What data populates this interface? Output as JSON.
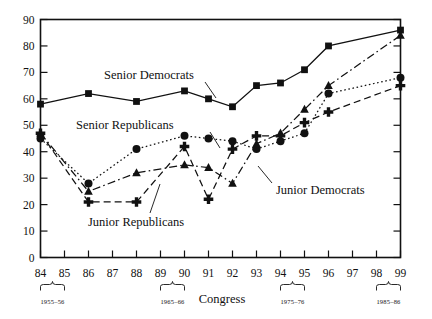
{
  "chart_data": {
    "type": "line",
    "title": "",
    "xlabel": "Congress",
    "ylabel": "",
    "ylim": [
      0,
      90
    ],
    "yticks": [
      0,
      10,
      20,
      30,
      40,
      50,
      60,
      70,
      80,
      90
    ],
    "xticks": [
      "84",
      "85",
      "86",
      "87",
      "88",
      "89",
      "90",
      "91",
      "92",
      "93",
      "94",
      "95",
      "96",
      "97",
      "98",
      "99"
    ],
    "grid": false,
    "legend": "inline-annotations",
    "x": [
      84,
      86,
      88,
      90,
      91,
      92,
      93,
      94,
      95,
      96,
      99
    ],
    "series": [
      {
        "name": "Senior Democrats",
        "marker": "square",
        "linestyle": "solid",
        "x": [
          84,
          86,
          88,
          90,
          91,
          92,
          93,
          94,
          95,
          96,
          99
        ],
        "values": [
          58,
          62,
          59,
          63,
          60,
          57,
          65,
          66,
          71,
          80,
          86
        ]
      },
      {
        "name": "Senior Republicans",
        "marker": "circle",
        "linestyle": "dotted",
        "x": [
          84,
          86,
          88,
          90,
          91,
          92,
          93,
          94,
          95,
          96,
          99
        ],
        "values": [
          45,
          28,
          41,
          46,
          45,
          44,
          41,
          44,
          47,
          62,
          68
        ]
      },
      {
        "name": "Junior Democrats",
        "marker": "triangle",
        "linestyle": "dashdot",
        "x": [
          84,
          86,
          88,
          90,
          91,
          92,
          93,
          94,
          95,
          96,
          99
        ],
        "values": [
          47,
          25,
          32,
          35,
          34,
          28,
          43,
          47,
          56,
          65,
          84
        ]
      },
      {
        "name": "Junior Republicans",
        "marker": "plus",
        "linestyle": "dashed",
        "x": [
          84,
          86,
          88,
          90,
          91,
          92,
          93,
          94,
          95,
          96,
          99
        ],
        "values": [
          47,
          21,
          21,
          42,
          22,
          41,
          46,
          46,
          51,
          55,
          65
        ]
      }
    ],
    "annotations": [
      {
        "label": "Senior Democrats",
        "x": 166,
        "y": 75
      },
      {
        "label": "Senior Republicans",
        "x": 158,
        "y": 125
      },
      {
        "label": "Junior Republicans",
        "x": 170,
        "y": 222
      },
      {
        "label": "Junior Democrats",
        "x": 288,
        "y": 188
      }
    ],
    "brackets": [
      {
        "label": "1955–56",
        "from": "84",
        "to": "85"
      },
      {
        "label": "1965–66",
        "from": "89",
        "to": "90"
      },
      {
        "label": "1975–76",
        "from": "94",
        "to": "95"
      },
      {
        "label": "1985–86",
        "from": "98",
        "to": "99"
      }
    ]
  },
  "axis": {
    "x_title": "Congress",
    "y_labels": [
      "90",
      "80",
      "70",
      "60",
      "50",
      "40",
      "30",
      "20",
      "10",
      "0"
    ],
    "x_labels": [
      "84",
      "85",
      "86",
      "87",
      "88",
      "89",
      "90",
      "91",
      "92",
      "93",
      "94",
      "95",
      "96",
      "97",
      "98",
      "99"
    ]
  },
  "labels": {
    "senior_democrats": "Senior Democrats",
    "senior_republicans": "Senior Republicans",
    "junior_republicans": "Junior Republicans",
    "junior_democrats": "Junior Democrats",
    "bracket1": "1955–56",
    "bracket2": "1965–66",
    "bracket3": "1975–76",
    "bracket4": "1985–86"
  },
  "colors": {
    "ink": "#111111",
    "background": "#ffffff"
  }
}
